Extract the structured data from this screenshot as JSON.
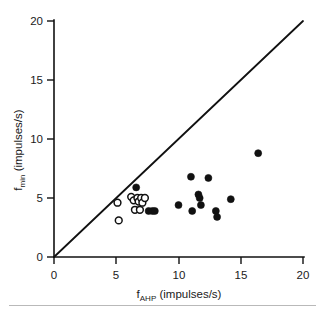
{
  "figure": {
    "background_color": "#ffffff",
    "ink_color": "#111111"
  },
  "axes": {
    "x": {
      "label_main": "f",
      "label_sub": "AHP",
      "label_units": " (impulses/s)",
      "label_full": "fAHP (impulses/s)",
      "ticks": [
        0,
        5,
        10,
        15,
        20
      ],
      "tick_labels": [
        "0",
        "5",
        "10",
        "15",
        "20"
      ],
      "min": 0,
      "max": 20
    },
    "y": {
      "label_main": "f",
      "label_sub": "min",
      "label_units": " (impulses/s)",
      "label_full": "fmin (impulses/s)",
      "ticks": [
        0,
        5,
        10,
        15,
        20
      ],
      "tick_labels": [
        "0",
        "5",
        "10",
        "15",
        "20"
      ],
      "min": 0,
      "max": 20
    }
  },
  "chart_data": {
    "type": "scatter",
    "title": "",
    "xlabel": "fAHP (impulses/s)",
    "ylabel": "fmin (impulses/s)",
    "xlim": [
      0,
      20
    ],
    "ylim": [
      0,
      20
    ],
    "xticks": [
      0,
      5,
      10,
      15,
      20
    ],
    "yticks": [
      0,
      5,
      10,
      15,
      20
    ],
    "grid": false,
    "legend": "none",
    "reference_line": {
      "name": "identity-line",
      "description": "line of identity y = x",
      "from": [
        0,
        0
      ],
      "to": [
        20,
        20
      ]
    },
    "series": [
      {
        "name": "open-circles",
        "marker": "open circle",
        "fill": "#ffffff",
        "edge": "#111111",
        "points": [
          [
            5.1,
            4.6
          ],
          [
            5.2,
            3.1
          ],
          [
            6.2,
            5.1
          ],
          [
            6.4,
            4.8
          ],
          [
            6.5,
            4.0
          ],
          [
            6.7,
            5.0
          ],
          [
            6.8,
            4.7
          ],
          [
            7.0,
            5.0
          ],
          [
            7.1,
            4.6
          ],
          [
            7.3,
            5.0
          ],
          [
            6.9,
            4.0
          ]
        ]
      },
      {
        "name": "filled-circles",
        "marker": "filled circle",
        "fill": "#111111",
        "edge": "#111111",
        "points": [
          [
            6.6,
            5.9
          ],
          [
            7.6,
            3.9
          ],
          [
            7.9,
            3.9
          ],
          [
            8.1,
            3.9
          ],
          [
            10.0,
            4.4
          ],
          [
            11.0,
            6.8
          ],
          [
            11.1,
            3.9
          ],
          [
            11.6,
            5.3
          ],
          [
            11.7,
            5.0
          ],
          [
            11.8,
            4.4
          ],
          [
            12.4,
            6.7
          ],
          [
            13.0,
            3.9
          ],
          [
            13.1,
            3.4
          ],
          [
            14.2,
            4.9
          ],
          [
            16.4,
            8.8
          ]
        ]
      }
    ]
  }
}
